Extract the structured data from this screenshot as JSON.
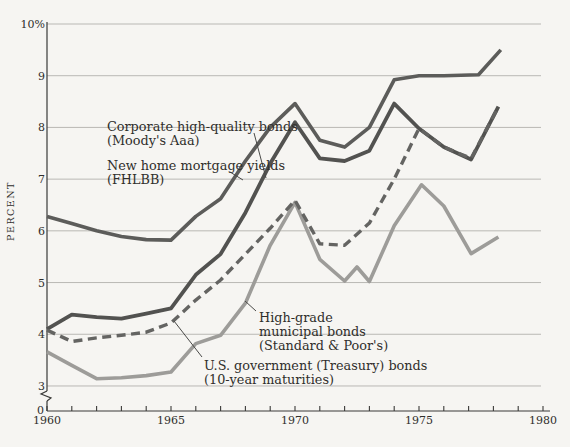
{
  "page": {
    "background": "#f6f5f2"
  },
  "chart_data": {
    "type": "line",
    "title": "",
    "ylabel": "PERCENT",
    "grid": true,
    "y_axis": {
      "top_label": "10%",
      "tick_labels": [
        "10%",
        "9",
        "8",
        "7",
        "6",
        "5",
        "4",
        "3"
      ],
      "tick_values": [
        10,
        9,
        8,
        7,
        6,
        5,
        4,
        3
      ],
      "zero_label": "0",
      "axis_break": true,
      "range_shown": [
        3,
        10
      ]
    },
    "x_axis": {
      "labels": [
        "1960",
        "1965",
        "1970",
        "1975",
        "1980"
      ],
      "label_years": [
        1960,
        1965,
        1970,
        1975,
        1980
      ],
      "minor_tick_interval": 1,
      "range": [
        1960,
        1980
      ]
    },
    "colors": {
      "background": "#f6f5f2",
      "gridline": "#b9b8b4",
      "axis": "#3a3a38",
      "text": "#2f2e2b",
      "mortgage_line": "#5c5c5a",
      "corporate_line": "#525250",
      "treasury_line": "#646462",
      "municipal_line": "#9d9c99"
    },
    "series": [
      {
        "id": "municipal",
        "name": "High-grade municipal bonds (Standard & Poor's)",
        "style": "solid",
        "color": "#9d9c99",
        "points": [
          [
            1960,
            3.66
          ],
          [
            1961,
            3.4
          ],
          [
            1962,
            3.14
          ],
          [
            1963,
            3.16
          ],
          [
            1964,
            3.2
          ],
          [
            1965,
            3.27
          ],
          [
            1966,
            3.82
          ],
          [
            1967,
            3.98
          ],
          [
            1968,
            4.6
          ],
          [
            1969,
            5.72
          ],
          [
            1970,
            6.55
          ],
          [
            1971,
            5.45
          ],
          [
            1972,
            5.03
          ],
          [
            1972.5,
            5.3
          ],
          [
            1973,
            5.02
          ],
          [
            1974,
            6.1
          ],
          [
            1975.1,
            6.89
          ],
          [
            1976,
            6.48
          ],
          [
            1977.1,
            5.56
          ],
          [
            1978.2,
            5.88
          ]
        ]
      },
      {
        "id": "corporate",
        "name": "Corporate high-quality bonds (Moody's Aaa)",
        "style": "solid",
        "color": "#525250",
        "points": [
          [
            1960,
            4.1
          ],
          [
            1961,
            4.38
          ],
          [
            1962,
            4.33
          ],
          [
            1963,
            4.3
          ],
          [
            1964,
            4.4
          ],
          [
            1965,
            4.5
          ],
          [
            1966,
            5.15
          ],
          [
            1967,
            5.55
          ],
          [
            1968,
            6.35
          ],
          [
            1969,
            7.3
          ],
          [
            1970,
            8.1
          ],
          [
            1971,
            7.4
          ],
          [
            1972,
            7.35
          ],
          [
            1973,
            7.55
          ],
          [
            1974,
            8.46
          ],
          [
            1975,
            7.98
          ],
          [
            1976,
            7.62
          ],
          [
            1977.1,
            7.38
          ],
          [
            1978.2,
            8.4
          ]
        ]
      },
      {
        "id": "mortgage",
        "name": "New home mortgage yields (FHLBB)",
        "style": "solid",
        "color": "#5c5c5a",
        "points": [
          [
            1960,
            6.28
          ],
          [
            1961,
            6.14
          ],
          [
            1962,
            6.0
          ],
          [
            1963,
            5.89
          ],
          [
            1964,
            5.83
          ],
          [
            1965,
            5.82
          ],
          [
            1966,
            6.28
          ],
          [
            1967,
            6.62
          ],
          [
            1968,
            7.35
          ],
          [
            1969,
            8.0
          ],
          [
            1970,
            8.46
          ],
          [
            1971,
            7.75
          ],
          [
            1972,
            7.62
          ],
          [
            1973,
            8.0
          ],
          [
            1974,
            8.92
          ],
          [
            1975,
            9.0
          ],
          [
            1976,
            9.0
          ],
          [
            1977.4,
            9.02
          ],
          [
            1978.3,
            9.5
          ]
        ]
      },
      {
        "id": "treasury",
        "name": "U.S. government (Treasury) bonds (10-year maturities)",
        "style": "dashed",
        "color": "#646462",
        "points": [
          [
            1960,
            4.08
          ],
          [
            1961,
            3.86
          ],
          [
            1962,
            3.93
          ],
          [
            1963,
            3.98
          ],
          [
            1964,
            4.04
          ],
          [
            1965,
            4.22
          ],
          [
            1966,
            4.66
          ],
          [
            1967,
            5.05
          ],
          [
            1968,
            5.55
          ],
          [
            1969,
            6.05
          ],
          [
            1970,
            6.59
          ],
          [
            1971,
            5.75
          ],
          [
            1972,
            5.72
          ],
          [
            1973,
            6.15
          ],
          [
            1974,
            7.0
          ],
          [
            1975,
            7.98
          ],
          [
            1976,
            7.62
          ],
          [
            1977.1,
            7.4
          ],
          [
            1978.2,
            8.4
          ]
        ]
      }
    ],
    "annotations": [
      {
        "id": "corporate",
        "lines": [
          "Corporate high-quality bonds",
          "(Moody's Aaa)"
        ]
      },
      {
        "id": "mortgage",
        "lines": [
          "New home mortgage yields",
          "(FHLBB)"
        ]
      },
      {
        "id": "municipal",
        "lines": [
          "High-grade",
          "municipal bonds",
          "(Standard & Poor's)"
        ]
      },
      {
        "id": "treasury",
        "lines": [
          "U.S. government (Treasury) bonds",
          "(10-year maturities)"
        ]
      }
    ]
  }
}
